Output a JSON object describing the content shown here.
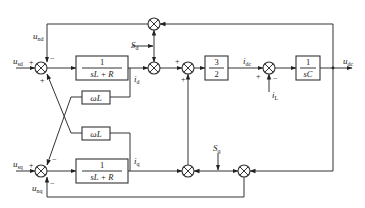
{
  "diagram": {
    "type": "control-block-diagram",
    "inputs": {
      "usd": {
        "main": "u",
        "sub": "sd"
      },
      "usq": {
        "main": "u",
        "sub": "sq"
      },
      "und": {
        "main": "u",
        "sub": "nd"
      },
      "unq": {
        "main": "u",
        "sub": "nq"
      },
      "Sd": {
        "main": "S",
        "sub": "d"
      },
      "Sq": {
        "main": "S",
        "sub": "q"
      },
      "iL": {
        "main": "i",
        "sub": "L"
      }
    },
    "signals": {
      "id": {
        "main": "i",
        "sub": "d"
      },
      "iq": {
        "main": "i",
        "sub": "q"
      },
      "idc": {
        "main": "i",
        "sub": "dc"
      },
      "udc": {
        "main": "u",
        "sub": "dc"
      }
    },
    "blocks": {
      "plant_d": {
        "num": "1",
        "den": "sL + R"
      },
      "plant_q": {
        "num": "1",
        "den": "sL + R"
      },
      "coupling_1": {
        "label": "ωL"
      },
      "coupling_2": {
        "label": "ωL"
      },
      "gain": {
        "num": "3",
        "den": "2"
      },
      "capacitor": {
        "num": "1",
        "den": "sC"
      }
    },
    "signs": {
      "sum_d_in": "+",
      "sum_d_fb": "−",
      "sum_d_cross": "+",
      "sum_q_in": "+",
      "sum_q_cross": "−",
      "sum_q_fb": "−",
      "sum_dq_top": "+",
      "sum_dq_bottom": "+",
      "sum_dc_in": "+",
      "sum_dc_load": "−"
    }
  }
}
